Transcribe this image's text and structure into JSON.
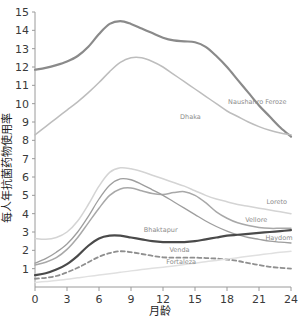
{
  "chart_data": {
    "type": "line",
    "title": "",
    "xlabel": "月龄",
    "ylabel": "每人年抗菌药物使用率",
    "xlim": [
      0,
      24
    ],
    "ylim": [
      0,
      15
    ],
    "xticks": [
      0,
      3,
      6,
      9,
      12,
      15,
      18,
      21,
      24
    ],
    "yticks": [
      1,
      2,
      3,
      4,
      5,
      6,
      7,
      8,
      9,
      10,
      11,
      12,
      13,
      14,
      15
    ],
    "grid": false,
    "legend": "inline-labels",
    "x": [
      0,
      1,
      2,
      3,
      4,
      5,
      6,
      7,
      8,
      9,
      10,
      11,
      12,
      13,
      14,
      15,
      16,
      17,
      18,
      19,
      20,
      21,
      22,
      23,
      24
    ],
    "series": [
      {
        "name": "Naushahro Feroze",
        "color": "#8a8a8a",
        "width": 2.2,
        "dash": "none",
        "label_x": 18.1,
        "label_y": 10.0,
        "values": [
          11.85,
          11.95,
          12.1,
          12.3,
          12.6,
          13.1,
          13.8,
          14.35,
          14.5,
          14.35,
          14.1,
          13.85,
          13.6,
          13.45,
          13.4,
          13.35,
          13.1,
          12.6,
          12.0,
          11.3,
          10.6,
          9.9,
          9.3,
          8.7,
          8.2
        ]
      },
      {
        "name": "Dhaka",
        "color": "#bdbdbd",
        "width": 1.5,
        "dash": "none",
        "label_x": 13.6,
        "label_y": 9.15,
        "values": [
          8.3,
          8.75,
          9.2,
          9.65,
          10.1,
          10.6,
          11.15,
          11.75,
          12.25,
          12.5,
          12.5,
          12.3,
          12.0,
          11.6,
          11.2,
          10.8,
          10.4,
          10.0,
          9.6,
          9.3,
          9.0,
          8.75,
          8.55,
          8.4,
          8.3
        ]
      },
      {
        "name": "Loreto",
        "color": "#d4d4d4",
        "width": 1.5,
        "dash": "none",
        "label_x": 21.7,
        "label_y": 4.55,
        "values": [
          2.65,
          2.6,
          2.7,
          3.0,
          3.6,
          4.5,
          5.5,
          6.25,
          6.5,
          6.45,
          6.3,
          6.1,
          5.9,
          5.7,
          5.5,
          5.25,
          5.0,
          4.8,
          4.65,
          4.5,
          4.4,
          4.3,
          4.2,
          4.1,
          4.0
        ]
      },
      {
        "name": "Vellore",
        "color": "#a8a8a8",
        "width": 1.5,
        "dash": "none",
        "label_x": 19.7,
        "label_y": 3.55,
        "values": [
          1.2,
          1.35,
          1.6,
          2.05,
          2.7,
          3.5,
          4.3,
          5.0,
          5.35,
          5.4,
          5.25,
          5.1,
          5.05,
          5.15,
          5.2,
          5.0,
          4.6,
          4.1,
          3.75,
          3.5,
          3.35,
          3.25,
          3.2,
          3.2,
          3.2
        ]
      },
      {
        "name": "Bhaktapur",
        "color": "#9e9e9e",
        "width": 1.3,
        "dash": "none",
        "label_x": 10.2,
        "label_y": 3.0,
        "values": [
          1.3,
          1.55,
          1.9,
          2.35,
          3.0,
          3.85,
          4.8,
          5.55,
          5.9,
          5.85,
          5.6,
          5.3,
          5.0,
          4.65,
          4.3,
          3.95,
          3.6,
          3.3,
          3.05,
          2.85,
          2.7,
          2.6,
          2.5,
          2.45,
          2.4
        ]
      },
      {
        "name": "Haydom",
        "color": "#4a4a4a",
        "width": 2.2,
        "dash": "none",
        "label_x": 21.6,
        "label_y": 2.55,
        "values": [
          0.65,
          0.75,
          0.95,
          1.25,
          1.7,
          2.25,
          2.65,
          2.8,
          2.8,
          2.7,
          2.6,
          2.5,
          2.45,
          2.45,
          2.45,
          2.5,
          2.6,
          2.7,
          2.8,
          2.85,
          2.9,
          2.95,
          3.0,
          3.05,
          3.1
        ]
      },
      {
        "name": "Venda",
        "color": "#8f8f8f",
        "width": 1.8,
        "dash": "4,3",
        "label_x": 12.6,
        "label_y": 1.9,
        "values": [
          0.45,
          0.5,
          0.6,
          0.8,
          1.05,
          1.35,
          1.65,
          1.85,
          1.95,
          1.9,
          1.8,
          1.7,
          1.62,
          1.6,
          1.6,
          1.6,
          1.58,
          1.55,
          1.5,
          1.42,
          1.3,
          1.2,
          1.1,
          1.05,
          1.0
        ]
      },
      {
        "name": "Fortaleza",
        "color": "#e0e0e0",
        "width": 1.5,
        "dash": "none",
        "label_x": 12.3,
        "label_y": 1.25,
        "values": [
          0.25,
          0.3,
          0.35,
          0.42,
          0.5,
          0.58,
          0.65,
          0.72,
          0.8,
          0.88,
          0.95,
          1.02,
          1.08,
          1.15,
          1.22,
          1.3,
          1.38,
          1.45,
          1.52,
          1.6,
          1.68,
          1.75,
          1.82,
          1.9,
          1.95
        ]
      }
    ]
  }
}
